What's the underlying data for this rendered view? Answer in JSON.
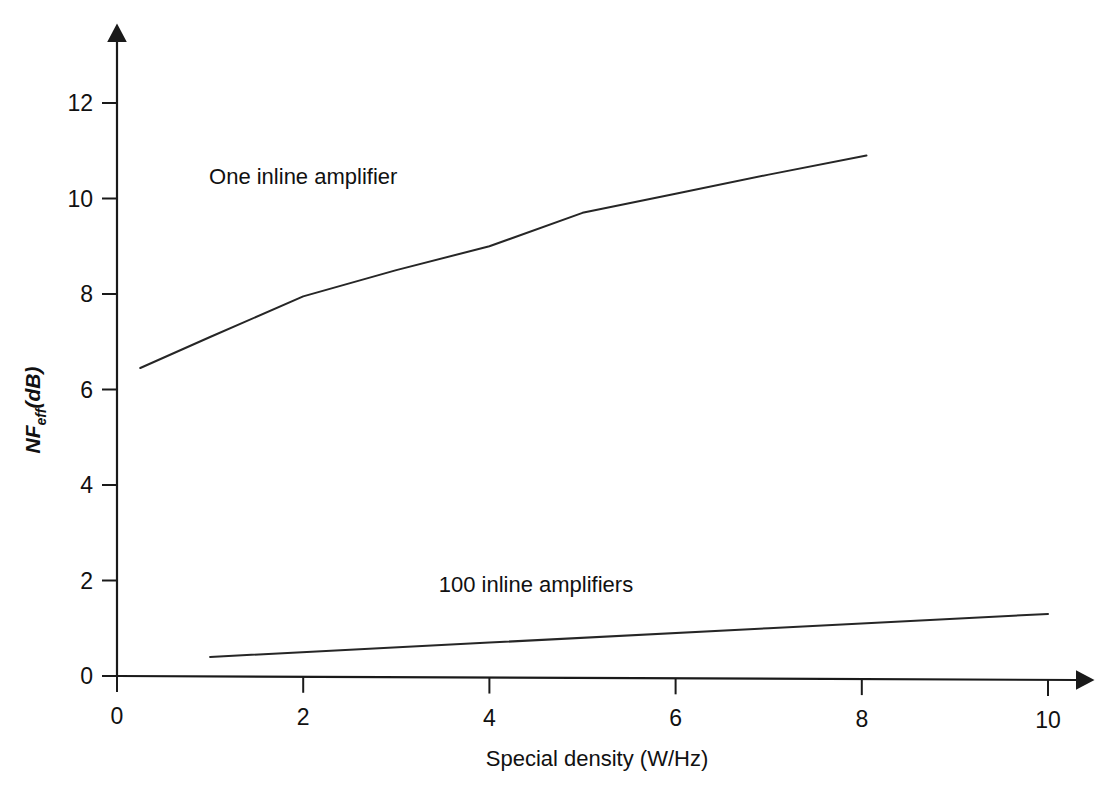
{
  "chart_data": {
    "type": "line",
    "title": "",
    "subtitle": "",
    "xlabel": "Special density (W/Hz)",
    "ylabel": "NF_eff(dB)",
    "ylabel_parts": {
      "main": "NF",
      "subscript": "eff",
      "unit": "(dB)"
    },
    "xlim": [
      0,
      10.6
    ],
    "ylim": [
      0,
      13.2
    ],
    "xticks": [
      0,
      2,
      4,
      6,
      8,
      10
    ],
    "xticklabels": [
      "0",
      "2",
      "4",
      "6",
      "8",
      "10"
    ],
    "yticks": [
      0,
      2,
      4,
      6,
      8,
      10,
      12
    ],
    "yticklabels": [
      "0",
      "2",
      "4",
      "6",
      "8",
      "10",
      "12"
    ],
    "grid": false,
    "legend_position": "inline-annotation",
    "axis_arrows": true,
    "series": [
      {
        "name": "One inline amplifier",
        "color": "#262626",
        "x": [
          0.25,
          1.0,
          2.0,
          3.0,
          4.0,
          5.0,
          6.0,
          7.0,
          8.05
        ],
        "values": [
          6.45,
          7.1,
          7.95,
          8.5,
          9.0,
          9.7,
          10.1,
          10.5,
          10.9
        ],
        "label": "One inline amplifier",
        "label_x": 2.0,
        "label_y": 10.3
      },
      {
        "name": "100 inline amplifiers",
        "color": "#262626",
        "x": [
          1.0,
          4.0,
          7.0,
          10.0
        ],
        "values": [
          0.4,
          0.7,
          1.0,
          1.3
        ],
        "label": "100 inline amplifiers",
        "label_x": 4.5,
        "label_y": 1.75
      }
    ],
    "annotations": [
      {
        "text": "One inline amplifier",
        "x": 2.0,
        "y": 10.3
      },
      {
        "text": "100 inline amplifiers",
        "x": 4.5,
        "y": 1.75
      }
    ]
  }
}
